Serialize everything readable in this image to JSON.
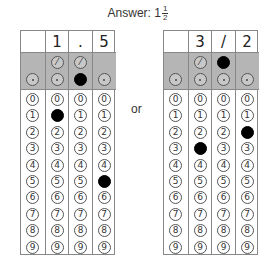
{
  "title": {
    "label": "Answer: ",
    "whole": "1",
    "numerator": "1",
    "denominator": "2"
  },
  "separator": "or",
  "digit_labels": [
    "0",
    "1",
    "2",
    "3",
    "4",
    "5",
    "6",
    "7",
    "8",
    "9"
  ],
  "grids": [
    {
      "name": "decimal-answer",
      "columns": [
        {
          "written": "",
          "has_slash": false,
          "slash_filled": false,
          "dot_filled": false,
          "filled_digit": null
        },
        {
          "written": "1",
          "has_slash": true,
          "slash_filled": false,
          "dot_filled": false,
          "filled_digit": 1
        },
        {
          "written": ".",
          "has_slash": true,
          "slash_filled": false,
          "dot_filled": true,
          "filled_digit": null
        },
        {
          "written": "5",
          "has_slash": false,
          "slash_filled": false,
          "dot_filled": false,
          "filled_digit": 5
        }
      ]
    },
    {
      "name": "fraction-answer",
      "columns": [
        {
          "written": "",
          "has_slash": false,
          "slash_filled": false,
          "dot_filled": false,
          "filled_digit": null
        },
        {
          "written": "3",
          "has_slash": true,
          "slash_filled": false,
          "dot_filled": false,
          "filled_digit": 3
        },
        {
          "written": "/",
          "has_slash": true,
          "slash_filled": true,
          "dot_filled": false,
          "filled_digit": null
        },
        {
          "written": "2",
          "has_slash": false,
          "slash_filled": false,
          "dot_filled": false,
          "filled_digit": 2
        }
      ]
    }
  ],
  "symbols": {
    "slash": "⁄",
    "dot": ""
  }
}
